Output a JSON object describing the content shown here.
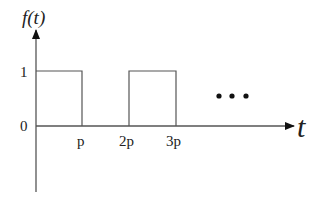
{
  "diagram": {
    "y_axis_label": "f(t)",
    "x_axis_label": "t",
    "y_ticks": [
      "1",
      "0"
    ],
    "x_ticks": [
      "p",
      "2p",
      "3p"
    ],
    "continuation": "• • •",
    "pulses": [
      {
        "start": "0",
        "end": "p",
        "level": "1"
      },
      {
        "start": "2p",
        "end": "3p",
        "level": "1"
      }
    ],
    "colors": {
      "line": "#555555",
      "text": "#222222"
    }
  }
}
